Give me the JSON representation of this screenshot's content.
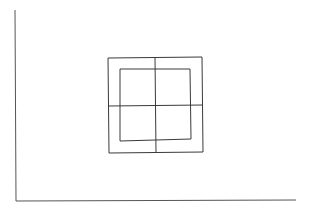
{
  "canvas": {
    "width": 312,
    "height": 212,
    "background": "#ffffff",
    "stroke_color": "#3a3a3a",
    "axis_color": "#555555"
  },
  "diagram": {
    "axes": {
      "vertical": {
        "x1": 15,
        "y1": 10,
        "x2": 16,
        "y2": 201
      },
      "horizontal": {
        "x1": 16,
        "y1": 201,
        "x2": 296,
        "y2": 200
      }
    },
    "outer_square": {
      "points": "108,58 202,57 203,152 109,153"
    },
    "inner_square": {
      "points": "120,69 190,69 191,139 120,141"
    },
    "cross": {
      "vertical": {
        "x1": 155,
        "y1": 57,
        "x2": 156,
        "y2": 153
      },
      "horizontal": {
        "x1": 108,
        "y1": 106,
        "x2": 203,
        "y2": 105
      }
    }
  }
}
